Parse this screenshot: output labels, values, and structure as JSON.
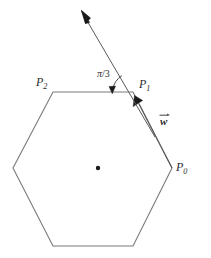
{
  "figure": {
    "type": "geometry-diagram",
    "background_color": "#ffffff",
    "line_color": "#7a7a7a",
    "text_color": "#2b2b2b",
    "dot_color": "#1a1a1a"
  },
  "labels": {
    "p0": {
      "base": "P",
      "sub": "0"
    },
    "p1": {
      "base": "P",
      "sub": "1"
    },
    "p2": {
      "base": "P",
      "sub": "2"
    },
    "angle": "/3",
    "angle_symbol": "π",
    "vector_w": "w"
  },
  "geometry": {
    "hexagon_vertices": [
      {
        "name": "P0",
        "x": 172,
        "y": 168
      },
      {
        "name": "P1",
        "x": 133,
        "y": 92
      },
      {
        "name": "P2",
        "x": 53,
        "y": 92
      },
      {
        "name": "P3",
        "x": 13,
        "y": 168
      },
      {
        "name": "P4",
        "x": 53,
        "y": 246
      },
      {
        "name": "P5",
        "x": 133,
        "y": 246
      }
    ],
    "center_dot": {
      "x": 98,
      "y": 168,
      "radius": 2.2
    },
    "ray": {
      "x1": 152,
      "y1": 131,
      "x2": 84,
      "y2": 14
    },
    "ray_arrow_tip": {
      "x": 82,
      "y": 11
    },
    "edge_arrow_tip": {
      "x": 138,
      "y": 102
    },
    "angle_arc": {
      "cx": 133,
      "cy": 92,
      "radius": 20,
      "from_deg": 120,
      "to_deg": 180
    }
  }
}
